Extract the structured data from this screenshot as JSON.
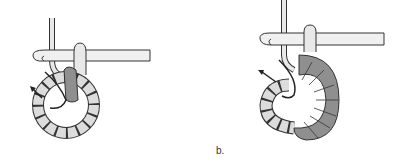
{
  "figures": [
    {
      "id": "a",
      "description": "Hook inserted into ring of chain stitches, first stitch worked (dark gray), arrow indicating yarn direction"
    },
    {
      "id": "b",
      "description": "Hook inserted into ring with multiple stitches worked around half the ring (dark gray), arrow indicating yarn direction"
    }
  ],
  "labels": {
    "b": "b."
  },
  "colors": {
    "outline": "#333333",
    "light_fill": "#dcdcdc",
    "dark_fill": "#8f8f8f",
    "hook_fill": "#f0f0f0"
  }
}
